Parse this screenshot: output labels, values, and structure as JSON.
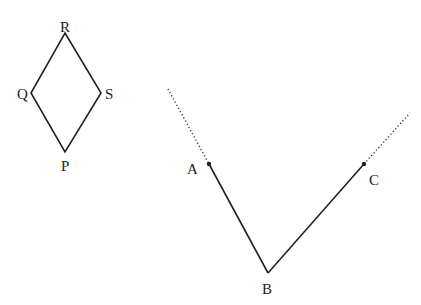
{
  "rhombus": {
    "vertices": [
      {
        "label": "R",
        "position": "top"
      },
      {
        "label": "S",
        "position": "right"
      },
      {
        "label": "P",
        "position": "bottom"
      },
      {
        "label": "Q",
        "position": "left"
      }
    ]
  },
  "angle": {
    "vertex": "B",
    "ray_points": [
      "A",
      "C"
    ],
    "labels": {
      "A": "A",
      "B": "B",
      "C": "C"
    },
    "rays_extended_dotted": true
  },
  "colors": {
    "line": "#222222",
    "background": "#ffffff"
  }
}
